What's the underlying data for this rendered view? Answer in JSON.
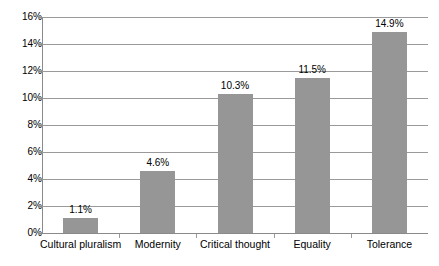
{
  "chart_data": {
    "type": "bar",
    "title": "",
    "subtitle": "",
    "xlabel": "",
    "ylabel": "",
    "categories": [
      "Cultural pluralism",
      "Modernity",
      "Critical thought",
      "Equality",
      "Tolerance"
    ],
    "values": [
      1.1,
      4.6,
      10.3,
      11.5,
      14.9
    ],
    "value_labels": [
      "1.1%",
      "4.6%",
      "10.3%",
      "11.5%",
      "14.9%"
    ],
    "ylim": [
      0,
      16
    ],
    "ytick_values": [
      0,
      2,
      4,
      6,
      8,
      10,
      12,
      14,
      16
    ],
    "ytick_labels": [
      "0%",
      "2%",
      "4%",
      "6%",
      "8%",
      "10%",
      "12%",
      "14%",
      "16%"
    ],
    "grid": true,
    "grid_axis": "y",
    "legend": false,
    "legend_position": "none",
    "series": [
      {
        "name": "",
        "values": [
          1.1,
          4.6,
          10.3,
          11.5,
          14.9
        ],
        "color": "#969696"
      }
    ],
    "colors": {
      "bar_fill": "#969696",
      "gridline": "#9a9a9a",
      "axis": "#8a8a8a",
      "text": "#000000",
      "background": "#ffffff"
    }
  }
}
